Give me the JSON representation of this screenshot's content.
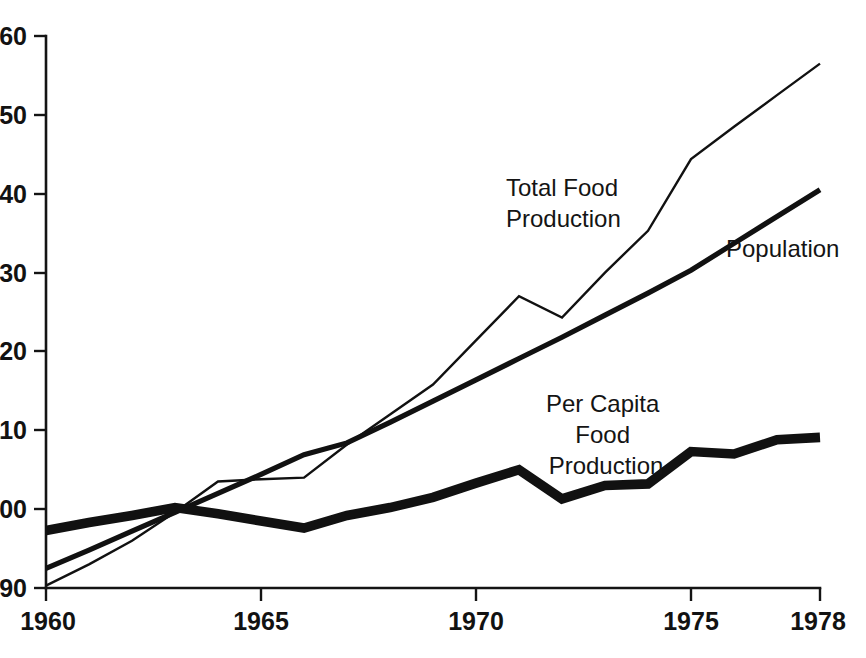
{
  "chart_data": {
    "type": "line",
    "title": "",
    "subtitle": "",
    "xlabel": "",
    "ylabel": "",
    "xlim": [
      1960,
      1978
    ],
    "ylim": [
      90,
      160
    ],
    "grid": false,
    "legend_position": "inline-annotations",
    "x_ticks": [
      "1960",
      "1965",
      "1970",
      "1975",
      "1978"
    ],
    "x_tick_values": [
      1960,
      1965,
      1970,
      1975,
      1978
    ],
    "y_ticks": [
      "90",
      "100",
      "110",
      "120",
      "130",
      "140",
      "150",
      "160"
    ],
    "y_tick_values": [
      90,
      100,
      110,
      120,
      130,
      140,
      150,
      160
    ],
    "x": [
      1960,
      1961,
      1962,
      1963,
      1964,
      1965,
      1966,
      1967,
      1968,
      1969,
      1970,
      1971,
      1972,
      1973,
      1974,
      1975,
      1976,
      1977,
      1978
    ],
    "series": [
      {
        "name": "Total Food Production",
        "style": "thin",
        "values": [
          90.3,
          93.0,
          96.0,
          99.6,
          103.5,
          103.8,
          104.0,
          108.2,
          112.0,
          115.8,
          121.4,
          127.0,
          124.3,
          130.0,
          135.3,
          144.4,
          148.5,
          152.5,
          156.5
        ]
      },
      {
        "name": "Population",
        "style": "medium",
        "values": [
          92.5,
          94.8,
          97.2,
          99.6,
          102.0,
          104.4,
          106.9,
          108.4,
          111.0,
          113.7,
          116.4,
          119.1,
          121.8,
          124.6,
          127.4,
          130.3,
          133.7,
          137.1,
          140.5
        ]
      },
      {
        "name": "Per Capita Food Production",
        "style": "thick",
        "values": [
          97.3,
          98.3,
          99.2,
          100.2,
          99.4,
          98.5,
          97.6,
          99.2,
          100.2,
          101.5,
          103.3,
          105.0,
          101.3,
          103.0,
          103.2,
          107.3,
          107.0,
          108.8,
          109.1
        ]
      }
    ],
    "annotations": [
      {
        "id": "total-food-production-label",
        "lines": [
          "Total Food",
          "Production"
        ],
        "align": "start",
        "x": 506,
        "y": 196
      },
      {
        "id": "population-label",
        "lines": [
          "Population"
        ],
        "align": "start",
        "x": 726,
        "y": 257
      },
      {
        "id": "per-capita-food-production-label",
        "lines": [
          "Per Capita",
          "Food",
          "Production"
        ],
        "align": "middle",
        "x": 606,
        "y": 412
      }
    ]
  },
  "axis": {
    "y_tick_labels": [
      "160",
      "150",
      "140",
      "130",
      "120",
      "110",
      "100",
      "90"
    ],
    "x_tick_labels": [
      "1960",
      "1965",
      "1970",
      "1975",
      "1978"
    ]
  },
  "annotations": {
    "total_food_line1": "Total Food",
    "total_food_line2": "Production",
    "population_line1": "Population",
    "per_capita_line1": "Per Capita",
    "per_capita_line2": "Food",
    "per_capita_line3": "Production"
  },
  "colors": {
    "ink": "#111111",
    "background": "#ffffff"
  }
}
